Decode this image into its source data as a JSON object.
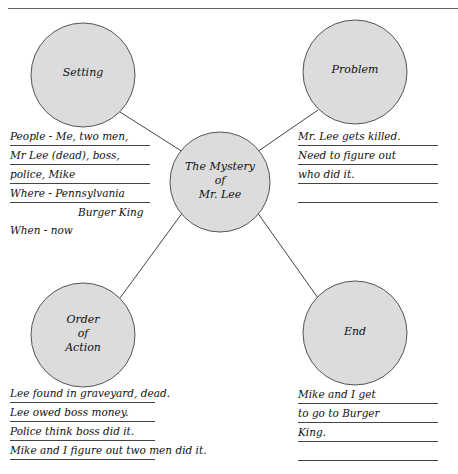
{
  "header": {
    "title": "",
    "rule_color": "#666666"
  },
  "colors": {
    "circle_fill": "#dcdcdc",
    "circle_stroke": "#555555",
    "connector": "#444444",
    "rule": "#444444"
  },
  "nodes": {
    "center": {
      "label_lines": [
        "The Mystery",
        "of",
        "Mr. Lee"
      ]
    },
    "setting": {
      "label": "Setting"
    },
    "problem": {
      "label": "Problem"
    },
    "order": {
      "label_lines": [
        "Order",
        "of",
        "Action"
      ]
    },
    "end": {
      "label": "End"
    }
  },
  "notes": {
    "setting": [
      "People - Me, two men,",
      "Mr Lee (dead), boss,",
      "police, Mike",
      "Where - Pennsylvania",
      "Burger King",
      "When - now"
    ],
    "problem": [
      "Mr. Lee gets killed.",
      "Need to figure out",
      "who did it.",
      ""
    ],
    "order": [
      "Lee found in graveyard, dead.",
      "Lee owed boss money.",
      "Police think boss did it.",
      "Mike and I figure out two men did it."
    ],
    "end": [
      "Mike and I get",
      "to go to Burger",
      "King.",
      ""
    ]
  }
}
